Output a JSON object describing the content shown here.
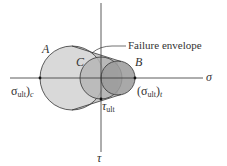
{
  "figure": {
    "axes": {
      "horizontal_label": "σ",
      "vertical_label": "τ"
    },
    "circles": [
      {
        "id": "A",
        "label": "A",
        "description": "uniaxial compression Mohr circle"
      },
      {
        "id": "C",
        "label": "C",
        "description": "pure shear Mohr circle"
      },
      {
        "id": "B",
        "label": "B",
        "description": "uniaxial tension Mohr circle"
      }
    ],
    "annotations": {
      "envelope_label": "Failure envelope",
      "compression_label": {
        "symbol": "σ",
        "sub": "ult",
        "suffix": ")",
        "tail": "c"
      },
      "tension_label": {
        "prefix": "(",
        "symbol": "σ",
        "sub": "ult",
        "suffix": ")",
        "tail": "t"
      },
      "shear_label": {
        "symbol": "τ",
        "sub": "ult"
      }
    },
    "colors": {
      "circle_A_fill": "#d9d9d9",
      "circle_C_fill": "#b3b3b3",
      "circle_B_fill": "#999999",
      "stroke": "#333333",
      "axis": "#333333"
    }
  }
}
